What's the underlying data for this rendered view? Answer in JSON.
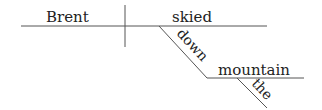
{
  "diagram": {
    "type": "sentence-diagram",
    "sentence": "Brent skied down the mountain",
    "words": {
      "subject": "Brent",
      "verb": "skied",
      "preposition": "down",
      "object": "mountain",
      "article": "the"
    },
    "colors": {
      "line": "#555555",
      "text": "#222222"
    }
  }
}
